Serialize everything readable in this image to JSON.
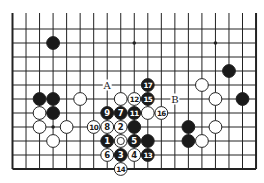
{
  "diagram": {
    "type": "go-board-fragment",
    "columns": 19,
    "rows_visible": 11,
    "top_edge_open": true,
    "grid": {
      "origin_x": 12.5,
      "origin_y": 29,
      "col_spacing": 13.53,
      "row_spacing": 14,
      "top_extension_y": 13
    },
    "colors": {
      "background": "#ffffff",
      "line": "#222222",
      "black_stone": "#1a1a1a",
      "white_stone": "#ffffff",
      "stone_outline": "#222222"
    },
    "star_points": [
      {
        "col": 3,
        "row": 1
      },
      {
        "col": 9,
        "row": 1
      },
      {
        "col": 15,
        "row": 1
      },
      {
        "col": 3,
        "row": 7
      },
      {
        "col": 9,
        "row": 7
      },
      {
        "col": 15,
        "row": 7
      }
    ],
    "stones": [
      {
        "col": 3,
        "row": 1,
        "color": "black",
        "label": ""
      },
      {
        "col": 16,
        "row": 3,
        "color": "black",
        "label": ""
      },
      {
        "col": 14,
        "row": 4,
        "color": "white",
        "label": ""
      },
      {
        "col": 10,
        "row": 4,
        "color": "black",
        "label": "17"
      },
      {
        "col": 2,
        "row": 5,
        "color": "black",
        "label": ""
      },
      {
        "col": 3,
        "row": 5,
        "color": "black",
        "label": ""
      },
      {
        "col": 5,
        "row": 5,
        "color": "white",
        "label": ""
      },
      {
        "col": 8,
        "row": 5,
        "color": "white",
        "label": ""
      },
      {
        "col": 9,
        "row": 5,
        "color": "white",
        "label": "12"
      },
      {
        "col": 10,
        "row": 5,
        "color": "black",
        "label": "15"
      },
      {
        "col": 15,
        "row": 5,
        "color": "white",
        "label": ""
      },
      {
        "col": 17,
        "row": 5,
        "color": "black",
        "label": ""
      },
      {
        "col": 2,
        "row": 6,
        "color": "white",
        "label": ""
      },
      {
        "col": 3,
        "row": 6,
        "color": "black",
        "label": ""
      },
      {
        "col": 7,
        "row": 6,
        "color": "black",
        "label": "9"
      },
      {
        "col": 8,
        "row": 6,
        "color": "black",
        "label": "7"
      },
      {
        "col": 9,
        "row": 6,
        "color": "black",
        "label": "11"
      },
      {
        "col": 10,
        "row": 6,
        "color": "white",
        "label": ""
      },
      {
        "col": 11,
        "row": 6,
        "color": "white",
        "label": "16"
      },
      {
        "col": 2,
        "row": 7,
        "color": "white",
        "label": ""
      },
      {
        "col": 4,
        "row": 7,
        "color": "white",
        "label": ""
      },
      {
        "col": 6,
        "row": 7,
        "color": "white",
        "label": "10"
      },
      {
        "col": 7,
        "row": 7,
        "color": "white",
        "label": "8"
      },
      {
        "col": 8,
        "row": 7,
        "color": "white",
        "label": "2"
      },
      {
        "col": 9,
        "row": 7,
        "color": "black",
        "label": ""
      },
      {
        "col": 13,
        "row": 7,
        "color": "black",
        "label": ""
      },
      {
        "col": 15,
        "row": 7,
        "color": "white",
        "label": ""
      },
      {
        "col": 3,
        "row": 8,
        "color": "white",
        "label": ""
      },
      {
        "col": 7,
        "row": 8,
        "color": "black",
        "label": "1"
      },
      {
        "col": 8,
        "row": 8,
        "color": "white",
        "label": "",
        "marker": "circle"
      },
      {
        "col": 9,
        "row": 8,
        "color": "black",
        "label": "5"
      },
      {
        "col": 10,
        "row": 8,
        "color": "black",
        "label": ""
      },
      {
        "col": 13,
        "row": 8,
        "color": "black",
        "label": ""
      },
      {
        "col": 14,
        "row": 8,
        "color": "white",
        "label": ""
      },
      {
        "col": 7,
        "row": 9,
        "color": "white",
        "label": "6"
      },
      {
        "col": 8,
        "row": 9,
        "color": "black",
        "label": "3"
      },
      {
        "col": 9,
        "row": 9,
        "color": "white",
        "label": "4"
      },
      {
        "col": 10,
        "row": 9,
        "color": "black",
        "label": "13"
      },
      {
        "col": 8,
        "row": 10,
        "color": "white",
        "label": "14"
      }
    ],
    "point_labels": [
      {
        "col": 7,
        "row": 4,
        "text": "A"
      },
      {
        "col": 12,
        "row": 5,
        "text": "B"
      }
    ]
  }
}
